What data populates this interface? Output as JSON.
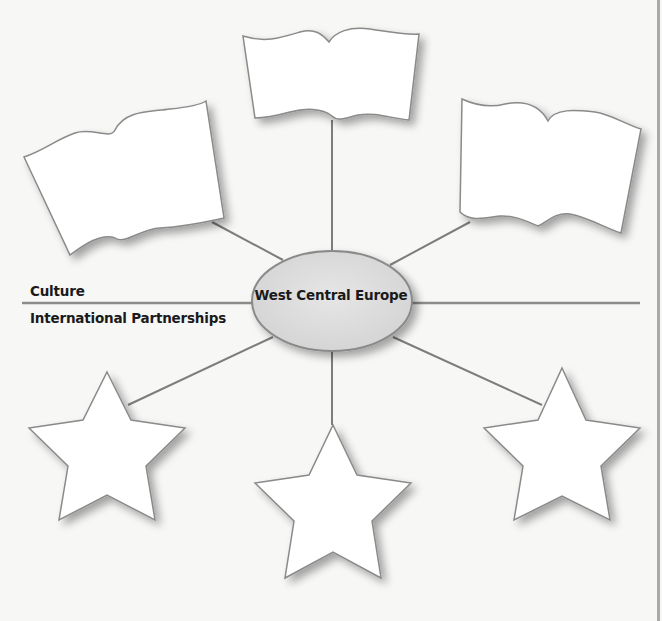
{
  "diagram": {
    "type": "concept-web",
    "center": {
      "label": "West Central Europe",
      "fill": "#dcdcdc",
      "stroke": "#8a8a8a"
    },
    "axis_labels": {
      "above_line": "Culture",
      "below_line": "International Partnerships"
    },
    "top_nodes": [
      {
        "shape": "flag",
        "position": "top-left",
        "text": ""
      },
      {
        "shape": "flag",
        "position": "top-center",
        "text": ""
      },
      {
        "shape": "flag",
        "position": "top-right",
        "text": ""
      }
    ],
    "bottom_nodes": [
      {
        "shape": "star",
        "position": "bottom-left",
        "text": ""
      },
      {
        "shape": "star",
        "position": "bottom-center",
        "text": ""
      },
      {
        "shape": "star",
        "position": "bottom-right",
        "text": ""
      }
    ],
    "colors": {
      "background": "#f7f7f6",
      "shape_fill": "#ffffff",
      "line": "#7d7d7d",
      "border": "#a9a9a9"
    }
  }
}
